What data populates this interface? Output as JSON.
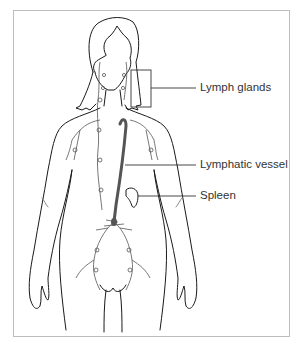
{
  "diagram": {
    "labels": [
      {
        "id": "lymph-glands",
        "text": "Lymph glands"
      },
      {
        "id": "lymphatic-vessel",
        "text": "Lymphatic vessel"
      },
      {
        "id": "spleen",
        "text": "Spleen"
      }
    ],
    "colors": {
      "outline": "#1a1a1a",
      "vessel": "#555555",
      "frame": "#bdbdbd",
      "text": "#333333"
    }
  }
}
